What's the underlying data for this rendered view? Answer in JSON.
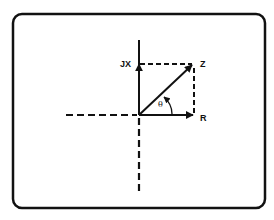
{
  "diagram": {
    "type": "phasor-diagram",
    "colors": {
      "stroke": "#111111",
      "background": "#ffffff"
    },
    "labels": {
      "imaginary": "JX",
      "resultant": "Z",
      "real": "R",
      "angle": "θ"
    },
    "nodes": [
      {
        "id": "origin",
        "x": 139,
        "y": 115
      },
      {
        "id": "jx",
        "label": "JX",
        "x": 139,
        "y": 64
      },
      {
        "id": "z",
        "label": "Z",
        "x": 194,
        "y": 64
      },
      {
        "id": "r",
        "label": "R",
        "x": 194,
        "y": 115
      }
    ],
    "edges": [
      {
        "from": "origin",
        "to": "jx",
        "style": "solid-arrow"
      },
      {
        "from": "origin",
        "to": "z",
        "style": "solid-arrow"
      },
      {
        "from": "origin",
        "to": "r",
        "style": "solid-arrow"
      },
      {
        "from": "jx",
        "to": "z",
        "style": "dashed"
      },
      {
        "from": "z",
        "to": "r",
        "style": "dashed"
      }
    ]
  }
}
